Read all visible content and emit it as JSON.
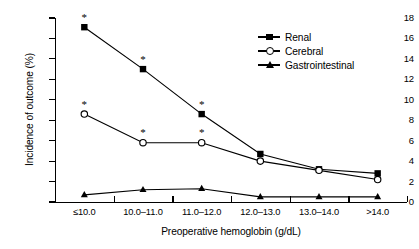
{
  "chart_data": {
    "type": "line",
    "title": "",
    "xlabel": "Preoperative hemoglobin (g/dL)",
    "ylabel": "Incidence of outcome (%)",
    "categories": [
      "≤10.0",
      "10.0–11.0",
      "11.0–12.0",
      "12.0–13.0",
      "13.0–14.0",
      ">14.0"
    ],
    "ylim": [
      0,
      18
    ],
    "yticks": [
      0,
      2,
      4,
      6,
      8,
      10,
      12,
      14,
      16,
      18
    ],
    "ytick_labels": [
      "0",
      "2",
      "4",
      "6",
      "8",
      "10",
      "12",
      "14",
      "16",
      "18"
    ],
    "grid": false,
    "legend_position": "top-right",
    "series": [
      {
        "name": "Renal",
        "marker": "filled-square",
        "values": [
          17.1,
          13.0,
          8.6,
          4.7,
          3.2,
          2.8
        ],
        "significance": [
          true,
          true,
          true,
          false,
          false,
          false
        ]
      },
      {
        "name": "Cerebral",
        "marker": "open-circle",
        "values": [
          8.6,
          5.8,
          5.8,
          4.0,
          3.1,
          2.2
        ],
        "significance": [
          true,
          true,
          true,
          false,
          false,
          false
        ]
      },
      {
        "name": "Gastrointestinal",
        "marker": "filled-triangle",
        "values": [
          0.7,
          1.2,
          1.3,
          0.5,
          0.5,
          0.5
        ],
        "significance": [
          false,
          false,
          false,
          false,
          false,
          false
        ]
      }
    ],
    "significance_symbol": "*",
    "colors": {
      "axis": "#000000",
      "series_renal": "#000000",
      "series_cerebral": "#000000",
      "series_gastrointestinal": "#000000",
      "background": "#ffffff"
    }
  },
  "legend": {
    "items": [
      {
        "label": "Renal"
      },
      {
        "label": "Cerebral"
      },
      {
        "label": "Gastrointestinal"
      }
    ]
  }
}
